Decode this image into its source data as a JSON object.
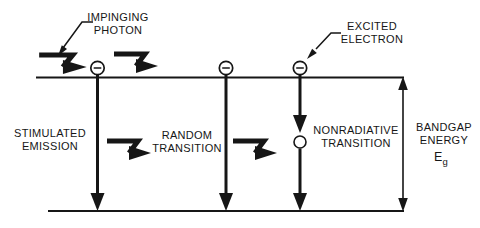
{
  "colors": {
    "ink": "#161616",
    "background": "#ffffff"
  },
  "diagram": {
    "callouts": {
      "impinging_photon": "IMPINGING\nPHOTON",
      "excited_electron": "EXCITED\nELECTRON"
    },
    "processes": {
      "stimulated_emission": "STIMULATED\nEMISSION",
      "random_transition": "RANDOM\nTRANSITION",
      "nonradiative_transition": "NONRADIATIVE\nTRANSITION"
    },
    "bandgap": {
      "label": "BANDGAP\nENERGY",
      "symbol": "E",
      "symbol_subscript": "g"
    }
  }
}
